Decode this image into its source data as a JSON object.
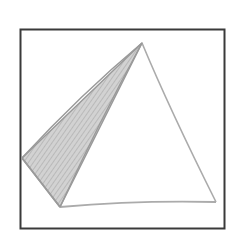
{
  "figure": {
    "frame": {
      "x": 20,
      "y": 29,
      "width": 205,
      "height": 200,
      "stroke": "#3a3a3a"
    },
    "vertices": {
      "apex": [
        142,
        43
      ],
      "left": [
        22,
        158
      ],
      "bottom_left": [
        60,
        207
      ],
      "bottom_right": [
        216,
        202
      ]
    },
    "shaded_face": {
      "fill": "#c8c8c8",
      "hatch": "#a8a8a8"
    },
    "edge_color": "#a9a9a9"
  }
}
